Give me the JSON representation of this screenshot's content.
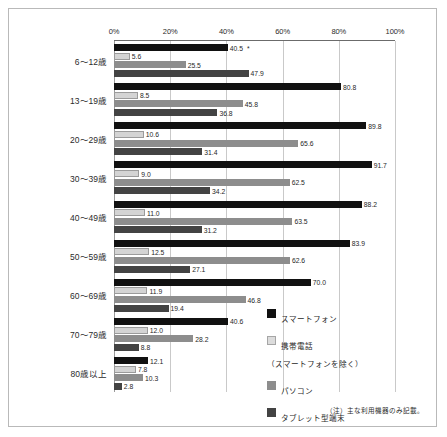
{
  "chart_data": {
    "type": "bar",
    "orientation": "horizontal",
    "title": "",
    "xlabel": "",
    "ylabel": "",
    "xlim": [
      0,
      100
    ],
    "xticks": [
      "0%",
      "20%",
      "40%",
      "60%",
      "80%",
      "100%"
    ],
    "xtick_values": [
      0,
      20,
      40,
      60,
      80,
      100
    ],
    "grid": true,
    "legend_position": "right",
    "categories": [
      "6〜12歳",
      "13〜19歳",
      "20〜29歳",
      "30〜39歳",
      "40〜49歳",
      "50〜59歳",
      "60〜69歳",
      "70〜79歳",
      "80歳以上"
    ],
    "series": [
      {
        "name": "スマートフォン",
        "color": "#111111",
        "values": [
          40.5,
          80.8,
          89.8,
          91.7,
          88.2,
          83.9,
          70.0,
          40.6,
          12.1
        ],
        "labels": [
          "40.5",
          "80.8",
          "89.8",
          "91.7",
          "88.2",
          "83.9",
          "70.0",
          "40.6",
          "12.1"
        ]
      },
      {
        "name": "携帯電話\n（スマートフォンを除く）",
        "color": "#d4d4d4",
        "values": [
          5.6,
          8.5,
          10.6,
          9.0,
          11.0,
          12.5,
          11.9,
          12.0,
          7.8
        ],
        "labels": [
          "5.6",
          "8.5",
          "10.6",
          "9.0",
          "11.0",
          "12.5",
          "11.9",
          "12.0",
          "7.8"
        ]
      },
      {
        "name": "パソコン",
        "color": "#8d8d8d",
        "values": [
          25.5,
          45.8,
          65.6,
          62.5,
          63.5,
          62.6,
          46.8,
          28.2,
          10.3
        ],
        "labels": [
          "25.5",
          "45.8",
          "65.6",
          "62.5",
          "63.5",
          "62.6",
          "46.8",
          "28.2",
          "10.3"
        ]
      },
      {
        "name": "タブレット型端末",
        "color": "#434343",
        "values": [
          47.9,
          36.8,
          31.4,
          34.2,
          31.2,
          27.1,
          19.4,
          8.8,
          2.8
        ],
        "labels": [
          "47.9",
          "36.8",
          "31.4",
          "34.2",
          "31.2",
          "27.1",
          "19.4",
          "8.8",
          "2.8"
        ]
      }
    ],
    "annotations": [
      {
        "category": "6〜12歳",
        "series": "スマートフォン",
        "mark": "*"
      }
    ]
  },
  "legend": {
    "items": [
      {
        "label": "スマートフォン",
        "color": "#111111"
      },
      {
        "label": "携帯電話\n（スマートフォンを除く）",
        "color": "#d4d4d4"
      },
      {
        "label": "パソコン",
        "color": "#8d8d8d"
      },
      {
        "label": "タブレット型端末",
        "color": "#434343"
      }
    ]
  },
  "footnote": "（注）主な利用機器のみ記載。"
}
